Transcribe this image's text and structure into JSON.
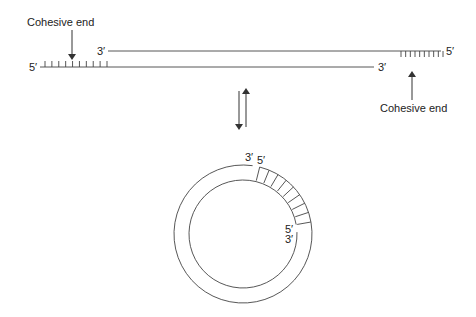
{
  "linear": {
    "left_label": "Cohesive end",
    "right_label": "Cohesive end",
    "top_strand_left_end": "3′",
    "top_strand_right_end": "5′",
    "bottom_strand_left_end": "5′",
    "bottom_strand_right_end": "3′",
    "left_overhang_ticks": 10,
    "right_overhang_ticks": 10
  },
  "equilibrium": {
    "icon": "reversible-arrows-icon"
  },
  "circular": {
    "outer_nick_left_end": "3′",
    "outer_nick_right_end": "5′",
    "inner_nick_top_end": "5′",
    "inner_nick_bottom_end": "3′",
    "paired_ticks": 9
  }
}
